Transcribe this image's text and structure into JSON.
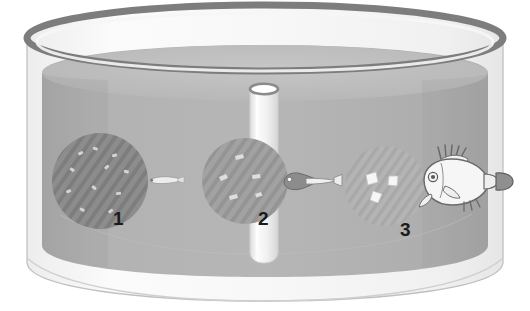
{
  "figure": {
    "title": "",
    "type": "scientific-illustration",
    "background_color": "#ffffff"
  },
  "tank": {
    "name": "rearing-tank",
    "shape": "cylinder",
    "rim_color": "#7d7d7d",
    "wall_color": "#f2f2f2",
    "wall_outline_color": "#b9b9b9",
    "water_color": "#b0b0b0",
    "water_top_color": "#c2c2c2",
    "water_shade_color": "#a0a0a0"
  },
  "standpipe": {
    "name": "central-standpipe",
    "body_color": "#ededed",
    "rim_color": "#8a8a8a",
    "top_opening_color": "#ffffff",
    "highlight_color": "#fafafa"
  },
  "stages": [
    {
      "number": "1",
      "label_name": "stage-number-1",
      "prey_patch": {
        "name": "prey-patch-1",
        "tone": "dark",
        "fill_color": "#8d8d8d",
        "stripe_color": "#7e7e7e",
        "particle_color": "#d8d8d8",
        "particle_count": 11,
        "particle_description": "small light specks (rotifers / microalgae)"
      },
      "organism": {
        "name": "fish-larva-newly-hatched",
        "description": "thin translucent newly hatched larva",
        "body_color": "#e8e8e8",
        "outline_color": "#9a9a9a",
        "eye_color": "#6d6d6d"
      }
    },
    {
      "number": "2",
      "label_name": "stage-number-2",
      "prey_patch": {
        "name": "prey-patch-2",
        "tone": "medium",
        "fill_color": "#a2a2a2",
        "stripe_color": "#949494",
        "particle_color": "#e2e2e2",
        "particle_count": 5,
        "particle_description": "larger light particles (Artemia nauplii)"
      },
      "organism": {
        "name": "fish-larva-developing",
        "description": "larva with pigmented head, eye and pale tail",
        "body_color": "#e8e8e8",
        "head_color": "#8a8a8a",
        "outline_color": "#6f6f6f",
        "eye_color": "#ffffff"
      }
    },
    {
      "number": "3",
      "label_name": "stage-number-3",
      "prey_patch": {
        "name": "prey-patch-3",
        "tone": "light",
        "fill_color": "#b4b4b4",
        "stripe_color": "#a8a8a8",
        "particle_color": "#f4f4f4",
        "particle_count": 3,
        "particle_description": "white flake / pellet dry feed"
      },
      "organism": {
        "name": "juvenile-fish",
        "description": "fully formed juvenile fish with spiny dorsal rays and dark caudal fin",
        "body_color": "#f4f4f4",
        "outline_color": "#6a6a6a",
        "tail_color": "#909090",
        "eye_color": "#5c5c5c"
      }
    }
  ]
}
